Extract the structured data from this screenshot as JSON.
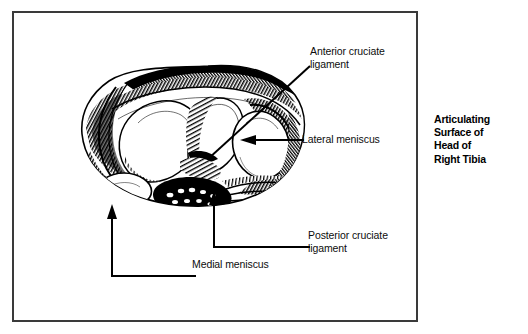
{
  "figure": {
    "caption": "Articulating\nSurface of\nHead of\nRight Tibia",
    "caption_lines": [
      "Articulating",
      "Surface of",
      "Head of",
      "Right Tibia"
    ],
    "frame_color": "#3a3a3a",
    "ink_color": "#000000",
    "background_color": "#ffffff"
  },
  "labels": {
    "anterior_cruciate_ligament": "Anterior cruciate\nligament",
    "lateral_meniscus": "Lateral meniscus",
    "posterior_cruciate_ligament": "Posterior cruciate\nligament",
    "medial_meniscus": "Medial meniscus"
  }
}
